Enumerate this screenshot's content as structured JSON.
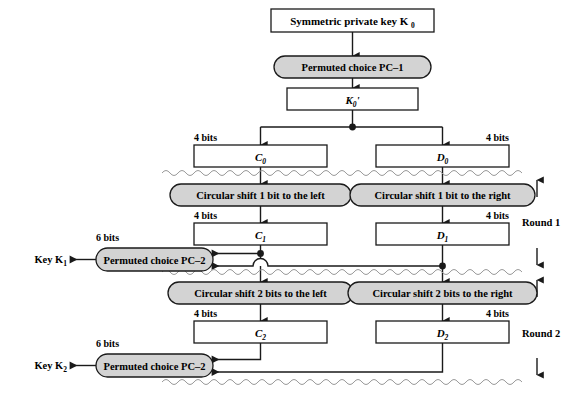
{
  "diagram": {
    "colors": {
      "pill_fill": "#d3d3d3",
      "box_fill": "#ffffff",
      "stroke": "#1a1a1a",
      "wave": "#9a9a9a",
      "background": "#ffffff"
    },
    "nodes": {
      "key_in": {
        "label": "Symmetric private key K",
        "sub": "0",
        "type": "rect"
      },
      "pc1": {
        "label": "Permuted choice PC–1",
        "type": "pill"
      },
      "k0p": {
        "label": "K",
        "sub": "0",
        "prime": "'",
        "type": "rect"
      },
      "c0": {
        "label": "C",
        "sub": "0",
        "type": "rect",
        "bits": "4 bits"
      },
      "d0": {
        "label": "D",
        "sub": "0",
        "type": "rect",
        "bits": "4 bits"
      },
      "shift_l1": {
        "label": "Circular shift 1 bit to the left",
        "type": "pill"
      },
      "shift_r1": {
        "label": "Circular shift 1 bit to the right",
        "type": "pill"
      },
      "c1": {
        "label": "C",
        "sub": "1",
        "type": "rect",
        "bits": "4 bits"
      },
      "d1": {
        "label": "D",
        "sub": "1",
        "type": "rect",
        "bits": "4 bits"
      },
      "pc2_r1": {
        "label": "Permuted choice PC–2",
        "type": "pill"
      },
      "key1": {
        "label": "Key K",
        "sub": "1",
        "bits": "6 bits"
      },
      "shift_l2": {
        "label": "Circular shift 2 bits to the left",
        "type": "pill"
      },
      "shift_r2": {
        "label": "Circular shift 2 bits to the right",
        "type": "pill"
      },
      "c2": {
        "label": "C",
        "sub": "2",
        "type": "rect",
        "bits": "4 bits"
      },
      "d2": {
        "label": "D",
        "sub": "2",
        "type": "rect",
        "bits": "4 bits"
      },
      "pc2_r2": {
        "label": "Permuted choice PC–2",
        "type": "pill"
      },
      "key2": {
        "label": "Key K",
        "sub": "2",
        "bits": "6 bits"
      }
    },
    "round_labels": {
      "round1": "Round 1",
      "round2": "Round 2"
    },
    "bit_labels": {
      "four_bits": "4 bits",
      "six_bits": "6 bits"
    }
  }
}
